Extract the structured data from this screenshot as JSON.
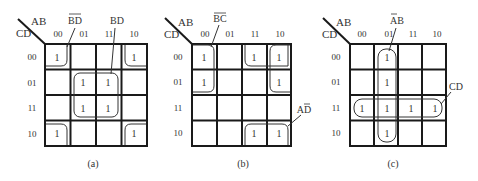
{
  "figure": {
    "kmaps": [
      {
        "id": "a",
        "caption": "(a)",
        "row_var": "CD",
        "col_var": "AB",
        "col_labels": [
          "00",
          "01",
          "11",
          "10"
        ],
        "row_labels": [
          "00",
          "01",
          "11",
          "10"
        ],
        "cells": [
          [
            "1",
            "",
            "",
            "1"
          ],
          [
            "",
            "1",
            "1",
            ""
          ],
          [
            "",
            "1",
            "1",
            ""
          ],
          [
            "1",
            "",
            "",
            "1"
          ]
        ],
        "groups": [
          {
            "label": "B̄D̄",
            "label_base": "BD",
            "overline": "both",
            "description": "four corners"
          },
          {
            "label": "BD",
            "label_base": "BD",
            "overline": "none",
            "description": "center 2x2 (AB=01,11; CD=01,11)"
          }
        ]
      },
      {
        "id": "b",
        "caption": "(b)",
        "row_var": "CD",
        "col_var": "AB",
        "col_labels": [
          "00",
          "01",
          "11",
          "10"
        ],
        "row_labels": [
          "00",
          "01",
          "11",
          "10"
        ],
        "cells": [
          [
            "1",
            "",
            "1",
            "1"
          ],
          [
            "1",
            "",
            "",
            "1"
          ],
          [
            "",
            "",
            "",
            ""
          ],
          [
            "",
            "",
            "1",
            "1"
          ]
        ],
        "groups": [
          {
            "label": "B̄C̄",
            "label_base": "BC",
            "overline": "both",
            "description": "AB=00,10 ; CD=00,01 (wraps)"
          },
          {
            "label": "AD̄",
            "label_base": "AD",
            "overline": "second",
            "description": "AB=11,10 ; CD=00,10 (wraps)"
          }
        ]
      },
      {
        "id": "c",
        "caption": "(c)",
        "row_var": "CD",
        "col_var": "AB",
        "col_labels": [
          "00",
          "01",
          "11",
          "10"
        ],
        "row_labels": [
          "00",
          "01",
          "11",
          "10"
        ],
        "cells": [
          [
            "",
            "1",
            "",
            ""
          ],
          [
            "",
            "1",
            "",
            ""
          ],
          [
            "1",
            "1",
            "1",
            "1"
          ],
          [
            "",
            "1",
            "",
            ""
          ]
        ],
        "groups": [
          {
            "label": "ĀB",
            "label_base": "AB",
            "overline": "first",
            "description": "column AB=01"
          },
          {
            "label": "CD",
            "label_base": "CD",
            "overline": "none",
            "description": "row CD=11"
          }
        ]
      }
    ]
  }
}
